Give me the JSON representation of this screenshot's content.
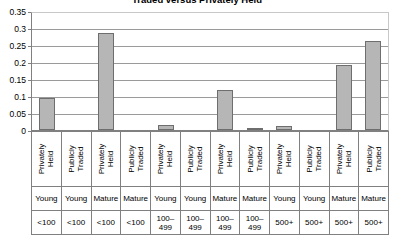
{
  "chart_data": {
    "type": "bar",
    "title": "Traded versus Privately Held",
    "xlabel": "",
    "ylabel": "",
    "ylim": [
      0,
      0.35
    ],
    "grid": true,
    "legend": "none",
    "yticks": [
      "0",
      "0.05",
      "0.1",
      "0.15",
      "0.2",
      "0.25",
      "0.3",
      "0.35"
    ],
    "ytick_values": [
      0,
      0.05,
      0.1,
      0.15,
      0.2,
      0.25,
      0.3,
      0.35
    ],
    "categories": [
      "Privately Held / Young / <100",
      "Publicly Traded / Young / <100",
      "Privately Held / Mature / <100",
      "Publicly Traded / Mature / <100",
      "Privately Held / Young / 100–499",
      "Publicly Traded / Young / 100–499",
      "Privately Held / Mature / 100–499",
      "Publicly Traded / Mature / 100–499",
      "Privately Held / Young / 500+",
      "Publicly Traded / Young / 500+",
      "Privately Held / Mature / 500+",
      "Publicly Traded / Mature / 500+"
    ],
    "values": [
      0.095,
      0,
      0.29,
      0,
      0.015,
      0,
      0.12,
      0.004,
      0.011,
      0,
      0.195,
      0.265
    ],
    "axis_tiers": {
      "tier1_label": "ownership",
      "tier2_label": "firm age",
      "tier3_label": "employment size"
    },
    "columns": [
      {
        "ownership_line1": "Privately",
        "ownership_line2": "Held",
        "age": "Young",
        "size": "<100",
        "value": 0.095
      },
      {
        "ownership_line1": "Publicly",
        "ownership_line2": "Traded",
        "age": "Young",
        "size": "<100",
        "value": 0
      },
      {
        "ownership_line1": "Privately",
        "ownership_line2": "Held",
        "age": "Mature",
        "size": "<100",
        "value": 0.29
      },
      {
        "ownership_line1": "Publicly",
        "ownership_line2": "Traded",
        "age": "Mature",
        "size": "<100",
        "value": 0
      },
      {
        "ownership_line1": "Privately",
        "ownership_line2": "Held",
        "age": "Young",
        "size": "100–\n499",
        "value": 0.015
      },
      {
        "ownership_line1": "Publicly",
        "ownership_line2": "Traded",
        "age": "Young",
        "size": "100–\n499",
        "value": 0
      },
      {
        "ownership_line1": "Privately",
        "ownership_line2": "Held",
        "age": "Mature",
        "size": "100–\n499",
        "value": 0.12
      },
      {
        "ownership_line1": "Publicly",
        "ownership_line2": "Traded",
        "age": "Mature",
        "size": "100–\n499",
        "value": 0.004
      },
      {
        "ownership_line1": "Privately",
        "ownership_line2": "Held",
        "age": "Young",
        "size": "500+",
        "value": 0.011
      },
      {
        "ownership_line1": "Publicly",
        "ownership_line2": "Traded",
        "age": "Young",
        "size": "500+",
        "value": 0
      },
      {
        "ownership_line1": "Privately",
        "ownership_line2": "Held",
        "age": "Mature",
        "size": "500+",
        "value": 0.195
      },
      {
        "ownership_line1": "Publicly",
        "ownership_line2": "Traded",
        "age": "Mature",
        "size": "500+",
        "value": 0.265
      }
    ],
    "colors": {
      "bar_fill": "#b6b6b6",
      "bar_border": "#6e6e6e",
      "gridline": "#9a9a9a",
      "axis": "#808080",
      "background": "#ffffff",
      "text": "#000000"
    }
  }
}
